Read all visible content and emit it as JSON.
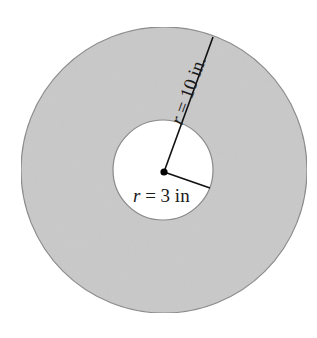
{
  "diagram": {
    "type": "annulus",
    "center": {
      "x": 164,
      "y": 171
    },
    "outer_circle": {
      "radius_px": 143,
      "fill": "#c9c9c9",
      "stroke": "#8a8a8a"
    },
    "inner_circle": {
      "radius_px": 50,
      "fill": "#ffffff",
      "stroke": "#8a8a8a"
    },
    "center_point": {
      "fill": "#000000"
    },
    "outer_radius": {
      "endpoint": {
        "x": 213,
        "y": 37
      },
      "label": {
        "var": "r",
        "rest": " = 10 in."
      }
    },
    "inner_radius": {
      "endpoint": {
        "x": 210,
        "y": 188
      },
      "label": {
        "var": "r",
        "rest": " = 3 in"
      }
    }
  }
}
